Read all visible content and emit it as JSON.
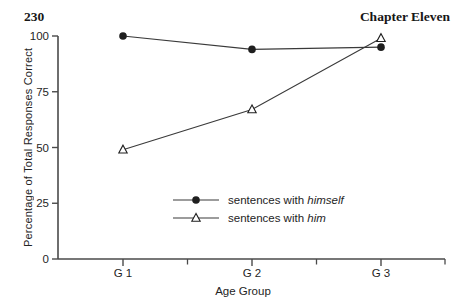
{
  "page": {
    "number": "230",
    "chapter": "Chapter Eleven"
  },
  "chart_data": {
    "type": "line",
    "categories": [
      "G 1",
      "G 2",
      "G 3"
    ],
    "series": [
      {
        "name": "sentences with himself",
        "label_prefix": "sentences with ",
        "label_italic": "himself",
        "marker": "filled-circle",
        "values": [
          100,
          94,
          95
        ]
      },
      {
        "name": "sentences with him",
        "label_prefix": "sentences with ",
        "label_italic": "him",
        "marker": "open-triangle",
        "values": [
          49,
          67,
          99
        ]
      }
    ],
    "title": "",
    "xlabel": "Age Group",
    "ylabel": "Percentage of Total Responses Correct",
    "yticks": [
      0,
      25,
      50,
      75,
      100
    ],
    "ylim": [
      0,
      100
    ],
    "grid": false,
    "legend_position": "inside-bottom-center",
    "colors": {
      "ink": "#1f1f1f",
      "axis": "#4a4a4a",
      "line": "#3a3a3a",
      "background": "#ffffff"
    }
  }
}
